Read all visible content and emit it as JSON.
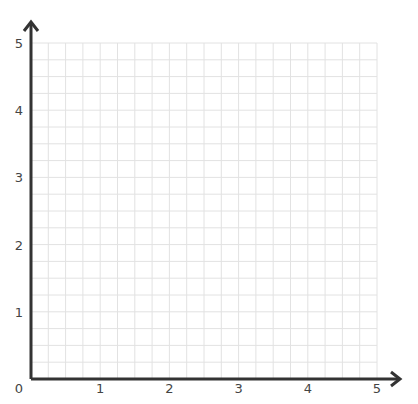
{
  "graph": {
    "x_min": 0,
    "x_max": 5,
    "y_min": 0,
    "y_max": 5,
    "subdivisions_per_unit": 4,
    "x_ticks": [
      "1",
      "2",
      "3",
      "4",
      "5"
    ],
    "y_ticks": [
      "1",
      "2",
      "3",
      "4",
      "5"
    ],
    "origin_label": "0",
    "grid_color": "#e2e2e2",
    "axis_color": "#333333"
  }
}
